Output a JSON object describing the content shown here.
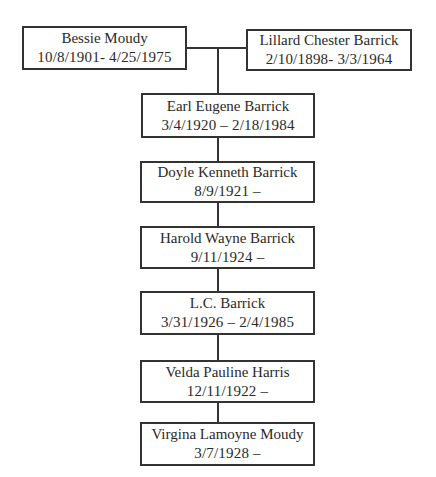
{
  "parents": [
    {
      "id": "bessie",
      "name": "Bessie Moudy",
      "dates": "10/8/1901- 4/25/1975"
    },
    {
      "id": "lillard",
      "name": "Lillard Chester Barrick",
      "dates": "2/10/1898- 3/3/1964"
    }
  ],
  "children": [
    {
      "id": "earl",
      "name": "Earl Eugene Barrick",
      "dates": "3/4/1920 – 2/18/1984"
    },
    {
      "id": "doyle",
      "name": "Doyle Kenneth Barrick",
      "dates": "8/9/1921 –"
    },
    {
      "id": "harold",
      "name": "Harold Wayne Barrick",
      "dates": "9/11/1924 –"
    },
    {
      "id": "lc",
      "name": "L.C. Barrick",
      "dates": "3/31/1926 – 2/4/1985"
    },
    {
      "id": "velda",
      "name": "Velda Pauline Harris",
      "dates": "12/11/1922 –"
    },
    {
      "id": "virgina",
      "name": "Virgina Lamoyne Moudy",
      "dates": "3/7/1928 –"
    }
  ],
  "colors": {
    "line": "#333333",
    "text": "#2a2a2a",
    "background": "#ffffff"
  }
}
